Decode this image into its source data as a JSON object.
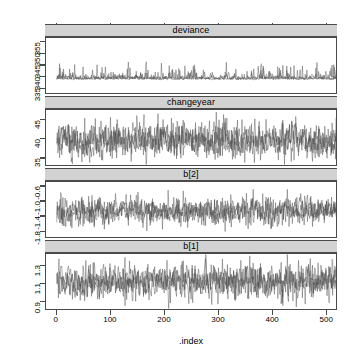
{
  "chart_data": {
    "type": "line",
    "title": "",
    "xlabel": ".index",
    "ylabel": "",
    "grid": false,
    "legend": "none",
    "layout": "4 stacked trace panels, shared x-axis, lattice strip headers",
    "x": {
      "label": ".index",
      "ticks": [
        0,
        100,
        200,
        300,
        400,
        500
      ],
      "tick_labels": [
        "0",
        "100",
        "200",
        "300",
        "400",
        "500"
      ],
      "range": [
        -20,
        520
      ],
      "n_iterations": 500
    },
    "panels": [
      {
        "name": "deviance",
        "strip_label": "deviance",
        "ylim": [
          333,
          356.5
        ],
        "ticks": [
          335,
          340,
          345,
          350,
          355
        ],
        "tick_labels": [
          "335",
          "340",
          "345",
          "350",
          "355"
        ],
        "mean": 338.6,
        "sd": 2.4,
        "n_chains": 3,
        "description": "Right-skewed deviance trace with upward spikes, baseline near 337"
      },
      {
        "name": "changeyear",
        "strip_label": "changeyear",
        "ylim": [
          33.2,
          47.5
        ],
        "ticks": [
          35,
          40,
          45
        ],
        "tick_labels": [
          "35",
          "40",
          "45"
        ],
        "mean": 39.6,
        "sd": 2.2,
        "n_chains": 3,
        "description": "Stationary noisy trace centered near 39.5"
      },
      {
        "name": "b[2]",
        "strip_label": "b[2]",
        "ylim": [
          -1.95,
          -0.5
        ],
        "ticks": [
          -1.8,
          -1.4,
          -1.0,
          -0.6
        ],
        "tick_labels": [
          "-1.8",
          "-1.4",
          "-1.0",
          "-0.6"
        ],
        "mean": -1.27,
        "sd": 0.17,
        "n_chains": 3,
        "description": "Stationary trace centered near -1.27"
      },
      {
        "name": "b[1]",
        "strip_label": "b[1]",
        "ylim": [
          0.82,
          1.42
        ],
        "ticks": [
          0.9,
          1.1,
          1.3
        ],
        "tick_labels": [
          "0.9",
          "1.1",
          "1.3"
        ],
        "mean": 1.12,
        "sd": 0.09,
        "n_chains": 3,
        "description": "Stationary trace centered near 1.12"
      }
    ],
    "colors": {
      "trace": "#4a4a4a",
      "strip_background": "#d2d2d2",
      "axis": "#4a4a4a",
      "panel_background": "#ffffff"
    }
  }
}
